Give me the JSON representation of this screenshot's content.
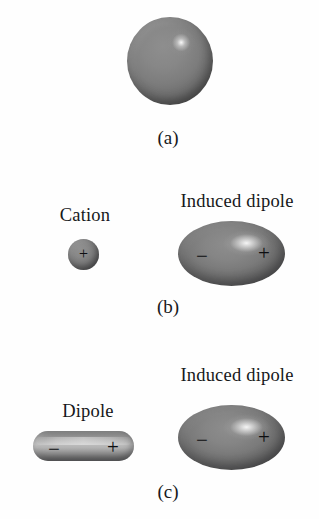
{
  "figure": {
    "background_color": "#ffffff",
    "shape_color": "#7a7a7a",
    "text_color": "#16181a",
    "width": 319,
    "height": 519
  },
  "panels": [
    {
      "caption": "(a)",
      "objects": [
        {
          "kind": "sphere",
          "name": "neutral-atom-sphere",
          "label": "",
          "charges": []
        }
      ]
    },
    {
      "caption": "(b)",
      "objects": [
        {
          "kind": "sphere",
          "name": "cation-sphere",
          "label": "Cation",
          "charges": [
            "+"
          ]
        },
        {
          "kind": "ellipse",
          "name": "induced-dipole-ellipse",
          "label": "Induced dipole",
          "charges": [
            "−",
            "+"
          ]
        }
      ]
    },
    {
      "caption": "(c)",
      "objects": [
        {
          "kind": "rod",
          "name": "dipole-rod",
          "label": "Dipole",
          "charges": [
            "−",
            "+"
          ]
        },
        {
          "kind": "ellipse",
          "name": "induced-dipole-ellipse",
          "label": "Induced dipole",
          "charges": [
            "−",
            "+"
          ]
        }
      ]
    }
  ],
  "labels": {
    "cation": "Cation",
    "dipole": "Dipole",
    "induced_dipole_b": "Induced dipole",
    "induced_dipole_c": "Induced dipole",
    "caption_a": "(a)",
    "caption_b": "(b)",
    "caption_c": "(c)"
  },
  "charges": {
    "plus": "+",
    "minus": "−"
  }
}
